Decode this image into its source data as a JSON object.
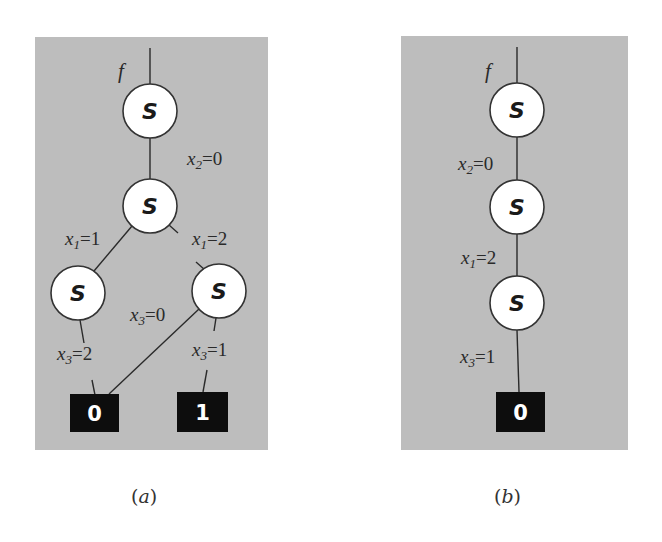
{
  "figure": {
    "panels": [
      {
        "id": "a",
        "caption": "(a)",
        "caption_letter": "a",
        "root_label": "f",
        "nodes": [
          {
            "id": "n1",
            "label": "S",
            "cx": 150,
            "cy": 111
          },
          {
            "id": "n2",
            "label": "S",
            "cx": 150,
            "cy": 206
          },
          {
            "id": "n3",
            "label": "S",
            "cx": 78,
            "cy": 293
          },
          {
            "id": "n4",
            "label": "S",
            "cx": 219,
            "cy": 291
          }
        ],
        "terminals": [
          {
            "id": "t0",
            "label": "0"
          },
          {
            "id": "t1",
            "label": "1"
          }
        ],
        "edges": [
          {
            "from": "f",
            "to": "n1",
            "label": ""
          },
          {
            "from": "n1",
            "to": "n2",
            "label": "x2=0",
            "var": "x",
            "sub": "2",
            "val": "=0"
          },
          {
            "from": "n2",
            "to": "n3",
            "label": "x1=1",
            "var": "x",
            "sub": "1",
            "val": "=1"
          },
          {
            "from": "n2",
            "to": "n4",
            "label": "x1=2",
            "var": "x",
            "sub": "1",
            "val": "=2"
          },
          {
            "from": "n3",
            "to": "t0",
            "label": "x3=2",
            "var": "x",
            "sub": "3",
            "val": "=2"
          },
          {
            "from": "n4",
            "to": "t0",
            "label": "x3=0",
            "var": "x",
            "sub": "3",
            "val": "=0"
          },
          {
            "from": "n4",
            "to": "t1",
            "label": "x3=1",
            "var": "x",
            "sub": "3",
            "val": "=1"
          }
        ]
      },
      {
        "id": "b",
        "caption": "(b)",
        "caption_letter": "b",
        "root_label": "f",
        "nodes": [
          {
            "id": "m1",
            "label": "S",
            "cx": 517,
            "cy": 110
          },
          {
            "id": "m2",
            "label": "S",
            "cx": 517,
            "cy": 207
          },
          {
            "id": "m3",
            "label": "S",
            "cx": 517,
            "cy": 303
          }
        ],
        "terminals": [
          {
            "id": "u0",
            "label": "0"
          }
        ],
        "edges": [
          {
            "from": "f",
            "to": "m1",
            "label": ""
          },
          {
            "from": "m1",
            "to": "m2",
            "label": "x2=0",
            "var": "x",
            "sub": "2",
            "val": "=0"
          },
          {
            "from": "m2",
            "to": "m3",
            "label": "x1=2",
            "var": "x",
            "sub": "1",
            "val": "=2"
          },
          {
            "from": "m3",
            "to": "u0",
            "label": "x3=1",
            "var": "x",
            "sub": "3",
            "val": "=1"
          }
        ]
      }
    ],
    "colors": {
      "panel_bg": "#bdbdbd",
      "node_fill": "#ffffff",
      "terminal_fill": "#0d0d0d",
      "edge": "#2a2a2a"
    }
  }
}
